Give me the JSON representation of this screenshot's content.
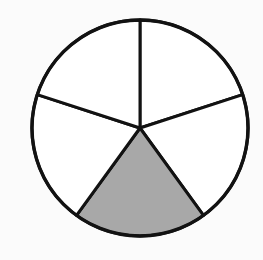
{
  "figure": {
    "shape_name": "pie-circle",
    "background_color": "#fbfbfb",
    "outline_color": "#121212",
    "outline_width_px": 3.4,
    "spoke_width_px": 3,
    "unshaded_fill": "#ffffff",
    "shaded_fill": "#a8a8a8",
    "center_x": 140,
    "center_y": 128,
    "radius": 108,
    "total_sectors": 5,
    "shaded_sectors": 1,
    "unshaded_sectors": 4,
    "sector_angle_degrees": 72,
    "fraction_shaded": "1/5"
  },
  "chart_data": {
    "type": "pie",
    "title": "",
    "categories": [
      "Sector 1",
      "Sector 2",
      "Sector 3",
      "Sector 4",
      "Sector 5"
    ],
    "values": [
      20,
      20,
      20,
      20,
      20
    ],
    "legend": [],
    "start_angle_degrees": 90,
    "direction": "clockwise",
    "slices": [
      {
        "name": "Sector 1",
        "label": "",
        "value": 20,
        "percent": 20,
        "start_angle": 90,
        "end_angle": 18,
        "fill": "#ffffff",
        "shaded": false
      },
      {
        "name": "Sector 2",
        "label": "",
        "value": 20,
        "percent": 20,
        "start_angle": 18,
        "end_angle": -54,
        "fill": "#ffffff",
        "shaded": false
      },
      {
        "name": "Sector 3",
        "label": "",
        "value": 20,
        "percent": 20,
        "start_angle": -54,
        "end_angle": -126,
        "fill": "#a8a8a8",
        "shaded": true
      },
      {
        "name": "Sector 4",
        "label": "",
        "value": 20,
        "percent": 20,
        "start_angle": -126,
        "end_angle": -198,
        "fill": "#ffffff",
        "shaded": false
      },
      {
        "name": "Sector 5",
        "label": "",
        "value": 20,
        "percent": 20,
        "start_angle": -198,
        "end_angle": -270,
        "fill": "#ffffff",
        "shaded": false
      }
    ]
  }
}
